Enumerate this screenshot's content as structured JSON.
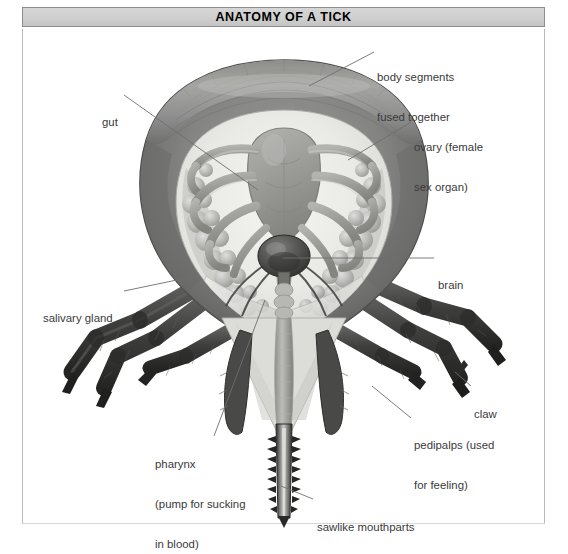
{
  "figure": {
    "title": "ANATOMY OF A TICK",
    "subject": "tick",
    "view": "ventral dissection illustration",
    "style": "grayscale scientific illustration"
  },
  "colors": {
    "page_background": "#ffffff",
    "title_bar_background": "#cfcfcf",
    "title_bar_border": "#8d8d8d",
    "frame_border": "#b9b9b9",
    "label_text": "#3a3a3a",
    "leader_line": "#6e6e6e",
    "body_rim_dark": "#6b6b6b",
    "body_interior_light": "#e9e9e7",
    "gut_mid_gray": "#9a9a98",
    "ovary_gray": "#b6b6b4",
    "brain_dark": "#4a4a4a",
    "leg_dark": "#3d3d3d",
    "mouthpart_dark": "#2f2f2f"
  },
  "labels": [
    {
      "id": "body-segments",
      "lines": [
        "body segments",
        "fused together"
      ],
      "text": "body segments fused together",
      "align": "left",
      "leader": {
        "from": [
          374,
          52
        ],
        "to": [
          309,
          86
        ]
      }
    },
    {
      "id": "gut",
      "lines": [
        "gut"
      ],
      "text": "gut",
      "align": "left",
      "leader": {
        "from": [
          124,
          95
        ],
        "to": [
          258,
          190
        ]
      }
    },
    {
      "id": "ovary",
      "lines": [
        "ovary (female",
        "sex organ)"
      ],
      "text": "ovary (female sex organ)",
      "align": "left",
      "leader": {
        "from": [
          411,
          122
        ],
        "to": [
          348,
          160
        ]
      }
    },
    {
      "id": "brain",
      "lines": [
        "brain"
      ],
      "text": "brain",
      "align": "left",
      "leader": {
        "from": [
          434,
          258
        ],
        "to": [
          283,
          258
        ]
      }
    },
    {
      "id": "salivary-gland",
      "lines": [
        "salivary gland"
      ],
      "text": "salivary gland",
      "align": "left",
      "leader": {
        "from": [
          124,
          291
        ],
        "to": [
          196,
          276
        ]
      }
    },
    {
      "id": "claw",
      "lines": [
        "claw"
      ],
      "text": "claw",
      "align": "left",
      "leader": {
        "from": [
          471,
          386
        ],
        "to": [
          455,
          372
        ]
      }
    },
    {
      "id": "pedipalps",
      "lines": [
        "pedipalps (used",
        "for feeling)"
      ],
      "text": "pedipalps (used for feeling)",
      "align": "left",
      "leader": {
        "from": [
          411,
          418
        ],
        "to": [
          372,
          386
        ]
      }
    },
    {
      "id": "pharynx",
      "lines": [
        "pharynx",
        "(pump for sucking",
        "in blood)"
      ],
      "text": "pharynx (pump for sucking in blood)",
      "align": "left",
      "leader": {
        "from": [
          214,
          436
        ],
        "to": [
          265,
          300
        ]
      }
    },
    {
      "id": "sawlike-mouthparts",
      "lines": [
        "sawlike mouthparts"
      ],
      "text": "sawlike mouthparts",
      "align": "left",
      "leader": {
        "from": [
          313,
          499
        ],
        "to": [
          281,
          486
        ]
      }
    }
  ],
  "anatomy_parts": [
    "body segments fused together",
    "gut",
    "ovary (female sex organ)",
    "brain",
    "salivary gland",
    "claw",
    "pedipalps (used for feeling)",
    "pharynx (pump for sucking in blood)",
    "sawlike mouthparts"
  ]
}
